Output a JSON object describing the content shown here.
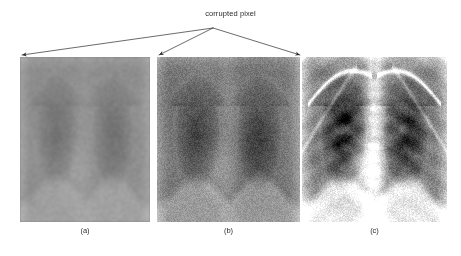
{
  "figure": {
    "width": 461,
    "height": 256,
    "background": "#ffffff",
    "annotation": {
      "label": "corrupted pixel",
      "color": "#2b2b2b",
      "apex": {
        "x": 213,
        "y": 28
      },
      "arrow_targets": [
        {
          "name": "panel-a-top-left",
          "x": 22,
          "y": 55
        },
        {
          "name": "panel-b-top-left",
          "x": 159,
          "y": 55
        },
        {
          "name": "panel-b-top-right",
          "x": 300,
          "y": 55
        }
      ]
    },
    "panels": [
      {
        "id": "a",
        "caption": "(a)",
        "name": "xray-panel-a",
        "description": "chest radiograph, heavily washed out low contrast",
        "x": 20,
        "y": 57,
        "width": 130,
        "height": 165,
        "base_gray": "#8d8d8d",
        "contrast": 0.3,
        "brightness": 0.55,
        "noise": 0.1,
        "spine_strength": 0.18,
        "rib_strength": 0.0,
        "clavicle_strength": 0.0
      },
      {
        "id": "b",
        "caption": "(b)",
        "name": "xray-panel-b",
        "description": "chest radiograph, partially restored medium contrast",
        "x": 157,
        "y": 57,
        "width": 143,
        "height": 165,
        "base_gray": "#707070",
        "contrast": 0.55,
        "brightness": 0.45,
        "noise": 0.13,
        "spine_strength": 0.3,
        "rib_strength": 0.08,
        "clavicle_strength": 0.05
      },
      {
        "id": "c",
        "caption": "(c)",
        "name": "xray-panel-c",
        "description": "chest radiograph, full contrast original with visible ribs, spine and clavicles",
        "x": 302,
        "y": 57,
        "width": 145,
        "height": 165,
        "base_gray": "#6a6a6a",
        "contrast": 1.0,
        "brightness": 0.5,
        "noise": 0.16,
        "spine_strength": 1.0,
        "rib_strength": 1.0,
        "clavicle_strength": 1.0
      }
    ]
  }
}
